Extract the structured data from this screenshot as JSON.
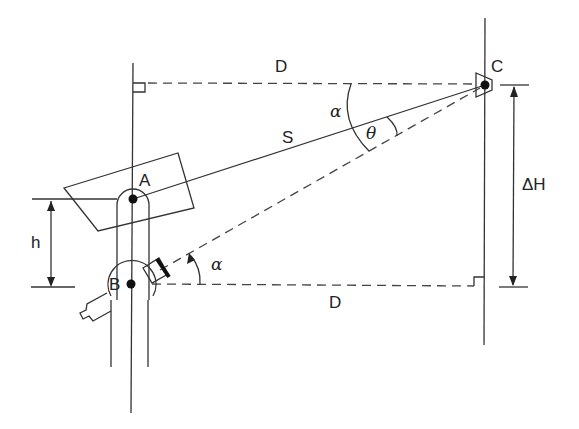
{
  "figure": {
    "type": "surveying-geometry-diagram",
    "points": [
      {
        "id": "A",
        "label": "A",
        "x": 133,
        "y": 199
      },
      {
        "id": "B",
        "label": "B",
        "x": 133,
        "y": 284
      },
      {
        "id": "C",
        "label": "C",
        "x": 484,
        "y": 85
      }
    ],
    "labels": {
      "top_distance": "D",
      "bottom_distance": "D",
      "slope_distance": "S",
      "height_diff": "ΔH",
      "instrument_height": "h",
      "angle_alpha_top": "α",
      "angle_alpha_bottom": "α",
      "angle_theta": "θ",
      "point_a": "A",
      "point_b": "B",
      "point_c": "C"
    },
    "colors": {
      "line": "#333333",
      "background": "#ffffff"
    }
  }
}
